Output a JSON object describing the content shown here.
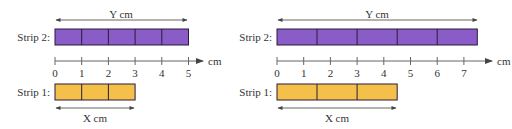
{
  "colors": {
    "strip2_fill": "#8a5cc8",
    "strip1_fill": "#f5c04a",
    "outline": "#2a1a3a",
    "axis": "#555555",
    "text": "#333333"
  },
  "panels": [
    {
      "id": "left",
      "strip2": {
        "label": "Strip 2:",
        "segments": 5,
        "length": 5,
        "dimension_label": "Y cm"
      },
      "strip1": {
        "label": "Strip 1:",
        "segments": 3,
        "length": 3,
        "dimension_label": "X cm"
      },
      "ruler": {
        "ticks": [
          "0",
          "1",
          "2",
          "3",
          "4",
          "5"
        ],
        "unit_label": "cm"
      }
    },
    {
      "id": "right",
      "strip2": {
        "label": "Strip 2:",
        "segments": 5,
        "length": 7.5,
        "dimension_label": "Y cm"
      },
      "strip1": {
        "label": "Strip 1:",
        "segments": 3,
        "length": 4.5,
        "dimension_label": "X cm"
      },
      "ruler": {
        "ticks": [
          "0",
          "1",
          "2",
          "3",
          "4",
          "5",
          "6",
          "7"
        ],
        "unit_label": "cm"
      }
    }
  ]
}
